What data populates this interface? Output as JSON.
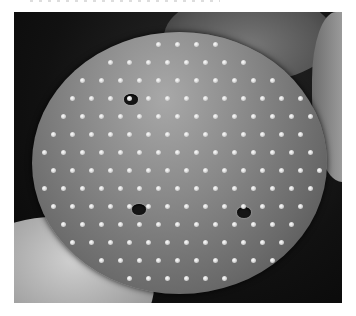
{
  "image": {
    "subject": "Scanning electron micrograph of a spiny pollen grain",
    "description": "Round echinate pollen grain with scattered conical spines and three visible pores, partially surrounded by neighboring grains on a dark background",
    "colors": {
      "background": "#ffffff",
      "micrograph_dark": "#111111",
      "grain_mid": "#8a8a8a",
      "spine_highlight": "#ffffff"
    },
    "visible_features": [
      "pollen-grain",
      "spines",
      "pores",
      "neighboring-grains"
    ]
  }
}
